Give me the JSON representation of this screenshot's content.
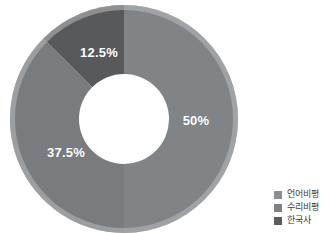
{
  "chart_data": {
    "type": "pie",
    "variant": "donut",
    "title": "",
    "subtitle": "",
    "xlabel": "",
    "ylabel": "",
    "grid": false,
    "legend_position": "bottom-right",
    "start_angle_deg": 0,
    "direction": "clockwise",
    "categories": [
      "언어비평",
      "수리비평",
      "한국사"
    ],
    "values": [
      50,
      37.5,
      12.5
    ],
    "value_unit": "%",
    "data_labels": [
      "50%",
      "37.5%",
      "12.5%"
    ],
    "colors": [
      "#808487",
      "#787c7f",
      "#58595b"
    ],
    "slices": [
      {
        "label": "언어비평",
        "value": 50,
        "data_label": "50%",
        "color": "#808487",
        "start_deg": 0,
        "end_deg": 180,
        "label_x": 196,
        "label_y": 120
      },
      {
        "label": "수리비평",
        "value": 37.5,
        "data_label": "37.5%",
        "color": "#787c7f",
        "start_deg": 180,
        "end_deg": 315,
        "label_x": 66,
        "label_y": 152
      },
      {
        "label": "한국사",
        "value": 12.5,
        "data_label": "12.5%",
        "color": "#58595b",
        "start_deg": 315,
        "end_deg": 360,
        "label_x": 99,
        "label_y": 52
      }
    ],
    "geometry": {
      "center_x": 124,
      "center_y": 119,
      "outer_radius": 114,
      "inner_radius": 45,
      "rim_color": "#b9bcbe",
      "rim_width": 5,
      "hole_color": "#ffffff"
    }
  },
  "legend": {
    "items": [
      {
        "label": "언어비평",
        "color": "#8a8e91",
        "swatch": "square-swatch-icon"
      },
      {
        "label": "수리비평",
        "color": "#7e8285",
        "swatch": "square-swatch-icon"
      },
      {
        "label": "한국사",
        "color": "#5a5b5d",
        "swatch": "square-swatch-icon"
      }
    ]
  }
}
